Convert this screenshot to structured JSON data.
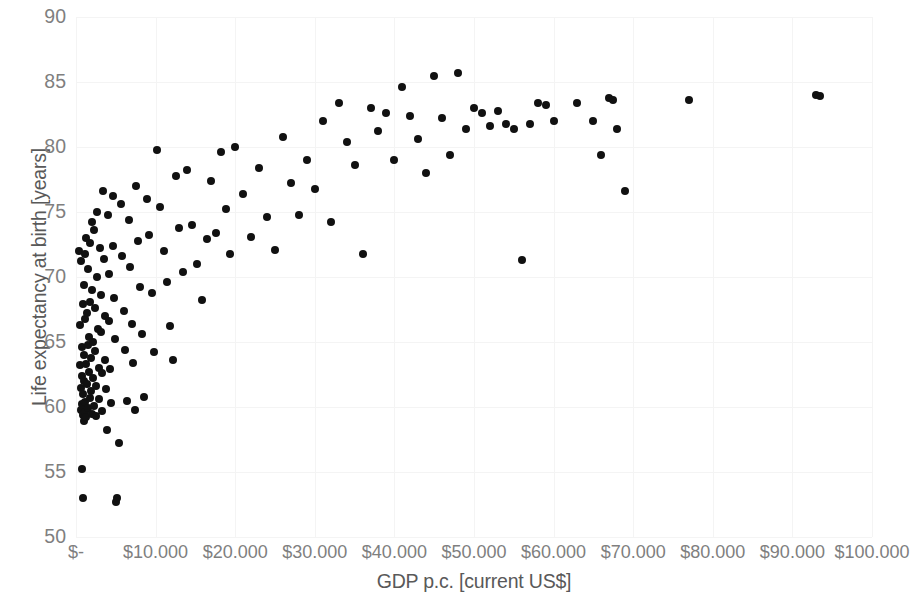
{
  "chart_data": {
    "type": "scatter",
    "title": "",
    "xlabel": "GDP p.c. [current US$]",
    "ylabel": "Life expectancy at birth [years]",
    "xlim": [
      0,
      100000
    ],
    "ylim": [
      50,
      90
    ],
    "xtick_labels": [
      "$-",
      "$10.000",
      "$20.000",
      "$30.000",
      "$40.000",
      "$50.000",
      "$60.000",
      "$70.000",
      "$80.000",
      "$90.000",
      "$100.000"
    ],
    "xtick_values": [
      0,
      10000,
      20000,
      30000,
      40000,
      50000,
      60000,
      70000,
      80000,
      90000,
      100000
    ],
    "ytick_labels": [
      "50",
      "55",
      "60",
      "65",
      "70",
      "75",
      "80",
      "85",
      "90"
    ],
    "ytick_values": [
      50,
      55,
      60,
      65,
      70,
      75,
      80,
      85,
      90
    ],
    "grid": true,
    "grid_color": "#f4f4f4",
    "legend": false,
    "marker_color": "#111111",
    "marker_size": 8,
    "series": [
      {
        "name": "Countries",
        "points": [
          [
            400,
            72.0
          ],
          [
            520,
            66.3
          ],
          [
            560,
            63.2
          ],
          [
            600,
            61.5
          ],
          [
            620,
            59.8
          ],
          [
            650,
            71.2
          ],
          [
            700,
            64.6
          ],
          [
            720,
            60.2
          ],
          [
            760,
            62.4
          ],
          [
            790,
            55.2
          ],
          [
            820,
            59.4
          ],
          [
            850,
            53.0
          ],
          [
            880,
            67.9
          ],
          [
            900,
            61.0
          ],
          [
            930,
            60.0
          ],
          [
            960,
            58.9
          ],
          [
            990,
            69.4
          ],
          [
            1020,
            64.0
          ],
          [
            1050,
            62.0
          ],
          [
            1080,
            59.6
          ],
          [
            1100,
            71.8
          ],
          [
            1150,
            66.8
          ],
          [
            1180,
            60.4
          ],
          [
            1220,
            63.3
          ],
          [
            1260,
            59.2
          ],
          [
            1300,
            73.0
          ],
          [
            1350,
            67.2
          ],
          [
            1400,
            61.8
          ],
          [
            1450,
            64.8
          ],
          [
            1500,
            59.9
          ],
          [
            1560,
            70.6
          ],
          [
            1600,
            65.4
          ],
          [
            1650,
            62.7
          ],
          [
            1700,
            60.7
          ],
          [
            1760,
            72.6
          ],
          [
            1800,
            68.1
          ],
          [
            1860,
            63.8
          ],
          [
            1900,
            61.2
          ],
          [
            1960,
            59.5
          ],
          [
            2000,
            74.2
          ],
          [
            2060,
            69.0
          ],
          [
            2120,
            65.0
          ],
          [
            2180,
            62.2
          ],
          [
            2240,
            60.1
          ],
          [
            2300,
            73.6
          ],
          [
            2360,
            67.6
          ],
          [
            2420,
            64.3
          ],
          [
            2480,
            61.6
          ],
          [
            2540,
            59.3
          ],
          [
            2600,
            75.0
          ],
          [
            2680,
            70.0
          ],
          [
            2760,
            66.0
          ],
          [
            2840,
            63.0
          ],
          [
            2920,
            60.6
          ],
          [
            3000,
            72.2
          ],
          [
            3080,
            68.6
          ],
          [
            3160,
            65.8
          ],
          [
            3240,
            62.6
          ],
          [
            3320,
            59.7
          ],
          [
            3400,
            76.6
          ],
          [
            3500,
            71.4
          ],
          [
            3600,
            67.0
          ],
          [
            3700,
            63.6
          ],
          [
            3800,
            61.4
          ],
          [
            3900,
            58.2
          ],
          [
            4000,
            74.8
          ],
          [
            4100,
            70.2
          ],
          [
            4200,
            66.6
          ],
          [
            4300,
            62.9
          ],
          [
            4400,
            60.3
          ],
          [
            4600,
            76.2
          ],
          [
            4700,
            72.4
          ],
          [
            4800,
            68.4
          ],
          [
            4900,
            65.2
          ],
          [
            5000,
            52.7
          ],
          [
            5200,
            53.0
          ],
          [
            5400,
            57.2
          ],
          [
            5600,
            75.6
          ],
          [
            5800,
            71.6
          ],
          [
            6000,
            67.4
          ],
          [
            6200,
            64.4
          ],
          [
            6400,
            60.5
          ],
          [
            6600,
            74.4
          ],
          [
            6800,
            70.8
          ],
          [
            7000,
            66.4
          ],
          [
            7200,
            63.4
          ],
          [
            7400,
            59.8
          ],
          [
            7600,
            77.0
          ],
          [
            7800,
            72.8
          ],
          [
            8000,
            69.2
          ],
          [
            8300,
            65.6
          ],
          [
            8600,
            60.8
          ],
          [
            8900,
            76.0
          ],
          [
            9200,
            73.2
          ],
          [
            9500,
            68.8
          ],
          [
            9800,
            64.2
          ],
          [
            10200,
            79.8
          ],
          [
            10600,
            75.4
          ],
          [
            11000,
            72.0
          ],
          [
            11400,
            69.6
          ],
          [
            11800,
            66.2
          ],
          [
            12200,
            63.6
          ],
          [
            12600,
            77.8
          ],
          [
            13000,
            73.8
          ],
          [
            13400,
            70.4
          ],
          [
            14000,
            78.2
          ],
          [
            14600,
            74.0
          ],
          [
            15200,
            71.0
          ],
          [
            15800,
            68.2
          ],
          [
            16400,
            72.9
          ],
          [
            17000,
            77.4
          ],
          [
            17600,
            73.4
          ],
          [
            18200,
            79.6
          ],
          [
            18800,
            75.2
          ],
          [
            19400,
            71.8
          ],
          [
            20000,
            80.0
          ],
          [
            21000,
            76.4
          ],
          [
            22000,
            73.1
          ],
          [
            23000,
            78.4
          ],
          [
            24000,
            74.6
          ],
          [
            25000,
            72.1
          ],
          [
            26000,
            80.8
          ],
          [
            27000,
            77.2
          ],
          [
            28000,
            74.8
          ],
          [
            29000,
            79.0
          ],
          [
            30000,
            76.8
          ],
          [
            31000,
            82.0
          ],
          [
            32000,
            74.2
          ],
          [
            33000,
            83.4
          ],
          [
            34000,
            80.4
          ],
          [
            35000,
            78.6
          ],
          [
            36000,
            71.8
          ],
          [
            37000,
            83.0
          ],
          [
            38000,
            81.2
          ],
          [
            39000,
            82.6
          ],
          [
            40000,
            79.0
          ],
          [
            41000,
            84.6
          ],
          [
            42000,
            82.4
          ],
          [
            43000,
            80.6
          ],
          [
            44000,
            78.0
          ],
          [
            45000,
            85.5
          ],
          [
            46000,
            82.2
          ],
          [
            47000,
            79.4
          ],
          [
            48000,
            85.7
          ],
          [
            49000,
            81.4
          ],
          [
            50000,
            83.0
          ],
          [
            51000,
            82.6
          ],
          [
            52000,
            81.6
          ],
          [
            53000,
            82.8
          ],
          [
            54000,
            81.8
          ],
          [
            55000,
            81.4
          ],
          [
            56000,
            71.3
          ],
          [
            57000,
            81.8
          ],
          [
            58000,
            83.4
          ],
          [
            59000,
            83.2
          ],
          [
            60000,
            82.0
          ],
          [
            63000,
            83.4
          ],
          [
            65000,
            82.0
          ],
          [
            66000,
            79.4
          ],
          [
            67000,
            83.8
          ],
          [
            67500,
            83.6
          ],
          [
            68000,
            81.4
          ],
          [
            69000,
            76.6
          ],
          [
            77000,
            83.6
          ],
          [
            93000,
            84.0
          ],
          [
            93500,
            83.9
          ]
        ]
      }
    ]
  }
}
